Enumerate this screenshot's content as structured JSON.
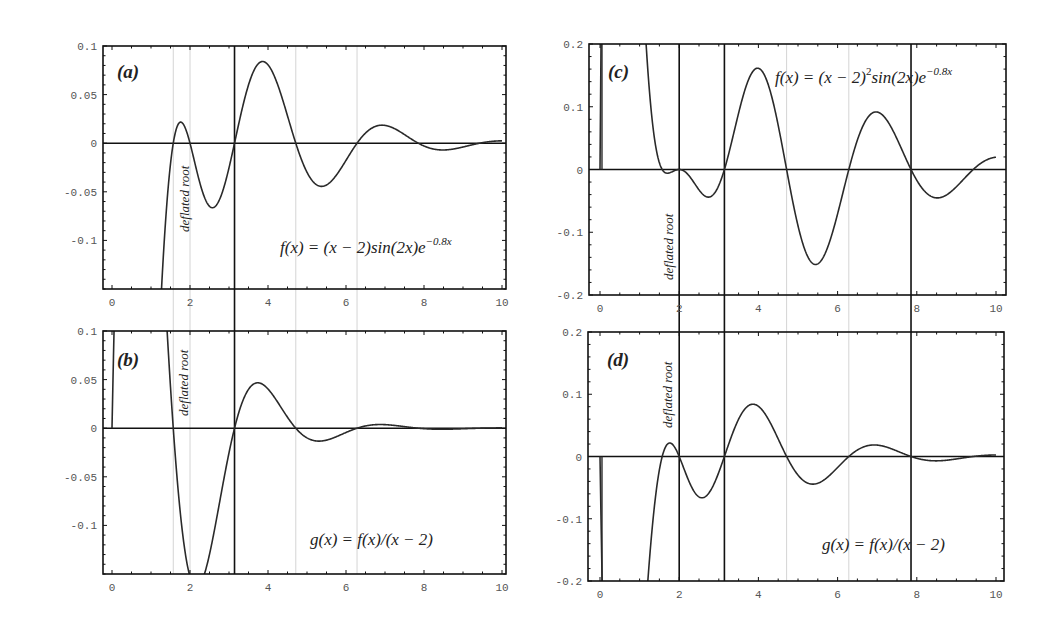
{
  "chart_data": [
    {
      "id": "a",
      "type": "line",
      "panel_label": "(a)",
      "formula_label": "f(x) = (x − 2)sin(2x)e",
      "formula_exponent": "−0.8x",
      "annotation": "deflated root",
      "function": "(x-2)*sin(2x)*exp(-0.8x)",
      "x_domain": [
        1.0,
        10
      ],
      "xlim": [
        0,
        10
      ],
      "ylim": [
        -0.15,
        0.1
      ],
      "xticks": [
        0,
        2,
        4,
        6,
        8,
        10
      ],
      "yticks": [
        0.1,
        0.05,
        0,
        -0.05,
        -0.1
      ],
      "ytick_labels": [
        "0.1",
        "0.05",
        "0",
        "-0.05",
        "-0.1"
      ],
      "black_vlines": [
        3.1416
      ],
      "gray_vlines": [
        1.5708,
        2,
        4.7124,
        6.2832
      ],
      "key_points": {
        "local_max_1": [
          1.8,
          0.021
        ],
        "local_min_1": [
          2.6,
          -0.066
        ],
        "local_max_2": [
          3.9,
          0.082
        ],
        "local_min_2": [
          5.4,
          -0.045
        ],
        "local_max_3": [
          7.0,
          0.017
        ],
        "local_min_3": [
          8.5,
          -0.008
        ]
      },
      "roots": [
        1.5708,
        2,
        3.1416,
        4.7124,
        6.2832,
        7.854,
        9.4248
      ]
    },
    {
      "id": "b",
      "type": "line",
      "panel_label": "(b)",
      "formula_label": "g(x) = f(x)/(x − 2)",
      "annotation": "deflated root",
      "function": "sin(2x)*exp(-0.8x)",
      "x_domain": [
        0,
        10
      ],
      "xlim": [
        0,
        10
      ],
      "ylim": [
        -0.15,
        0.1
      ],
      "xticks": [
        0,
        2,
        4,
        6,
        8,
        10
      ],
      "yticks": [
        0.1,
        0.05,
        0,
        -0.05,
        -0.1
      ],
      "ytick_labels": [
        "0.1",
        "0.05",
        "0",
        "-0.05",
        "-0.1"
      ],
      "black_vlines": [
        3.1416
      ],
      "gray_vlines": [
        1.5708,
        2,
        4.7124,
        6.2832
      ],
      "key_points": {
        "local_max_1": [
          3.8,
          0.046
        ],
        "local_min_1": [
          5.4,
          -0.015
        ],
        "local_max_2": [
          6.9,
          0.003
        ]
      },
      "roots": [
        1.5708,
        3.1416,
        4.7124,
        6.2832,
        7.854,
        9.4248
      ]
    },
    {
      "id": "c",
      "type": "line",
      "panel_label": "(c)",
      "formula_label": "f(x) = (x − 2)",
      "formula_square": "2",
      "formula_rest": "sin(2x)e",
      "formula_exponent": "−0.8x",
      "annotation": "deflated root",
      "function": "(x-2)^2*sin(2x)*exp(-0.8x)",
      "x_domain": [
        0,
        10
      ],
      "xlim": [
        0,
        10
      ],
      "ylim": [
        -0.2,
        0.2
      ],
      "xticks": [
        0,
        2,
        4,
        6,
        8,
        10
      ],
      "yticks": [
        0.2,
        0.1,
        0,
        -0.1,
        -0.2
      ],
      "ytick_labels": [
        "0.2",
        "0.1",
        "0",
        "-0.1",
        "-0.2"
      ],
      "black_vlines": [
        2,
        3.1416,
        7.854
      ],
      "gray_vlines": [
        4.7124,
        6.2832
      ],
      "key_points": {
        "local_min_1": [
          2.75,
          -0.046
        ],
        "local_max_1": [
          4.0,
          0.158
        ],
        "local_min_2": [
          5.45,
          -0.153
        ],
        "local_max_2": [
          7.0,
          0.087
        ],
        "local_min_3": [
          8.55,
          -0.047
        ]
      },
      "roots": [
        0,
        1.5708,
        2,
        3.1416,
        4.7124,
        6.2832,
        7.854,
        9.4248
      ]
    },
    {
      "id": "d",
      "type": "line",
      "panel_label": "(d)",
      "formula_label": "g(x) = f(x)/(x − 2)",
      "annotation": "deflated root",
      "function": "(x-2)*sin(2x)*exp(-0.8x)",
      "x_domain": [
        0,
        10
      ],
      "xlim": [
        0,
        10
      ],
      "ylim": [
        -0.2,
        0.2
      ],
      "xticks": [
        0,
        2,
        4,
        6,
        8,
        10
      ],
      "yticks": [
        0.2,
        0.1,
        0,
        -0.1,
        -0.2
      ],
      "ytick_labels": [
        "0.2",
        "0.1",
        "0",
        "-0.1",
        "-0.2"
      ],
      "black_vlines": [
        2,
        3.1416,
        7.854
      ],
      "gray_vlines": [
        4.7124,
        6.2832
      ],
      "key_points": {
        "local_max_1": [
          1.8,
          0.021
        ],
        "local_min_1": [
          2.6,
          -0.066
        ],
        "local_max_2": [
          3.9,
          0.082
        ],
        "local_min_2": [
          5.4,
          -0.045
        ],
        "local_max_3": [
          7.0,
          0.017
        ]
      },
      "roots": [
        0,
        1.5708,
        2,
        3.1416,
        4.7124,
        6.2832,
        7.854,
        9.4248
      ]
    }
  ],
  "layout": {
    "panels": {
      "a": {
        "left": 103,
        "right": 506,
        "top": 46,
        "bottom": 289,
        "x0px": 112,
        "x10px": 502
      },
      "b": {
        "left": 103,
        "right": 506,
        "top": 331,
        "bottom": 574,
        "x0px": 112,
        "x10px": 502
      },
      "c": {
        "left": 589,
        "right": 1006,
        "top": 44,
        "bottom": 295,
        "x0px": 600,
        "x10px": 996
      },
      "d": {
        "left": 588,
        "right": 1004,
        "top": 332,
        "bottom": 581,
        "x0px": 600,
        "x10px": 996
      }
    },
    "colors": {
      "curve": "#2a2a2a",
      "axis": "#111111",
      "gray_line": "#d4d4d4",
      "tick_label": "#555555"
    }
  }
}
